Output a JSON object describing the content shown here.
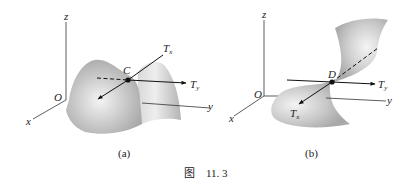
{
  "figure": {
    "caption_prefix": "图",
    "caption_number": "11. 3",
    "panels": [
      {
        "id": "a",
        "label": "(a)",
        "axes": {
          "z": "z",
          "x": "x",
          "y": "y",
          "origin": "O"
        },
        "point": "C",
        "tangent_x": {
          "main": "T",
          "sub": "x"
        },
        "tangent_y": {
          "main": "T",
          "sub": "y"
        },
        "surface": "saddle-shaped-surface"
      },
      {
        "id": "b",
        "label": "(b)",
        "axes": {
          "z": "z",
          "x": "x",
          "y": "y",
          "origin": "O"
        },
        "point": "D",
        "tangent_x": {
          "main": "T",
          "sub": "x"
        },
        "tangent_y": {
          "main": "T",
          "sub": "y"
        },
        "surface": "twisted-surface"
      }
    ]
  },
  "colors": {
    "surface_light": "#f2f2f2",
    "surface_mid": "#c8c8c8",
    "surface_dark": "#a6a6a6",
    "ink": "#111111"
  }
}
